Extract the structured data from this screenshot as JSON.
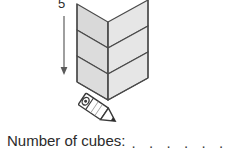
{
  "worksheet": {
    "figure": {
      "name": "isometric-cube-stack",
      "height_label": "5",
      "arrow_direction": "down",
      "cube_columns": 2,
      "cube_rows": 3,
      "face_fill": "#e0e0e0",
      "face_fill_left": "#d4d4d4",
      "outline_color": "#4a4a4a",
      "pencil_icon": "pencil-icon"
    },
    "question": {
      "label": "Number of cubes:",
      "answer_value": "",
      "answer_dots": ". . . . . . . ."
    }
  }
}
